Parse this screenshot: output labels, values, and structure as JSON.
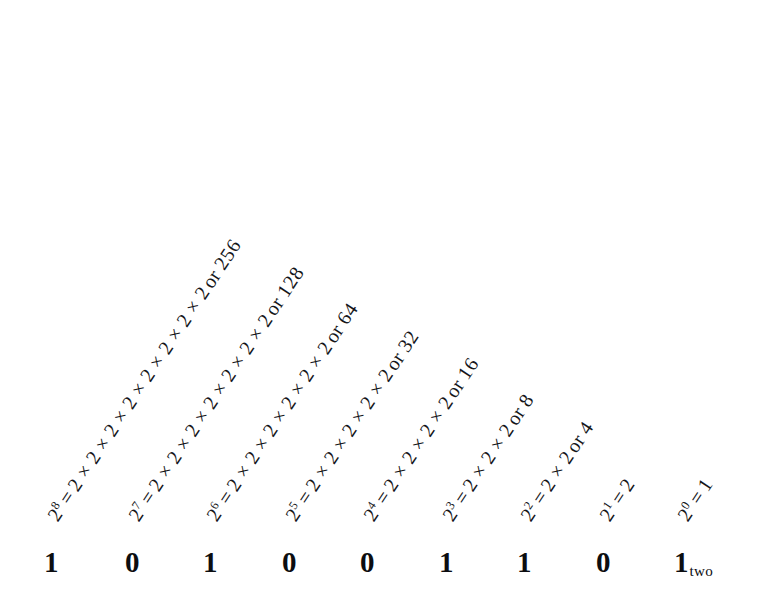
{
  "figure": {
    "kind": "binary-place-value-diagram",
    "background_color": "#ffffff",
    "text_color": "#15161a",
    "digit_color": "#0c0d10",
    "rotation_degrees": -56.5,
    "multiplication_sign": "×",
    "equals_sign": "=",
    "or_word": "or",
    "base_subscript": "two"
  },
  "rows": [
    {
      "base": "2",
      "exponent": "8",
      "equals": "=",
      "expression": "2 × 2 × 2 × 2 × 2 × 2 × 2 × 2",
      "or": "or",
      "value": "256",
      "factor_count": 8,
      "left": 52,
      "top": 509
    },
    {
      "base": "2",
      "exponent": "7",
      "equals": "=",
      "expression": "2 × 2 × 2 × 2 × 2 × 2 × 2",
      "or": "or",
      "value": "128",
      "factor_count": 7,
      "left": 133,
      "top": 509
    },
    {
      "base": "2",
      "exponent": "6",
      "equals": "=",
      "expression": "2 × 2 × 2 × 2 × 2 × 2",
      "or": "or",
      "value": "64",
      "factor_count": 6,
      "left": 211,
      "top": 509
    },
    {
      "base": "2",
      "exponent": "5",
      "equals": "=",
      "expression": "2 × 2 × 2 × 2 × 2",
      "or": "or",
      "value": "32",
      "factor_count": 5,
      "left": 290,
      "top": 509
    },
    {
      "base": "2",
      "exponent": "4",
      "equals": "=",
      "expression": "2 × 2 × 2 × 2",
      "or": "or",
      "value": "16",
      "factor_count": 4,
      "left": 368,
      "top": 509
    },
    {
      "base": "2",
      "exponent": "3",
      "equals": "=",
      "expression": "2 × 2 × 2",
      "or": "or",
      "value": "8",
      "factor_count": 3,
      "left": 447,
      "top": 509
    },
    {
      "base": "2",
      "exponent": "2",
      "equals": "=",
      "expression": "2 × 2",
      "or": "or",
      "value": "4",
      "factor_count": 2,
      "left": 525,
      "top": 509
    },
    {
      "base": "2",
      "exponent": "1",
      "equals": "=",
      "expression": "2",
      "or": "",
      "value": "",
      "factor_count": 1,
      "left": 604,
      "top": 509
    },
    {
      "base": "2",
      "exponent": "0",
      "equals": "=",
      "expression": "1",
      "or": "",
      "value": "",
      "factor_count": 0,
      "left": 682,
      "top": 509
    }
  ],
  "binary_number": {
    "digits": [
      {
        "value": "1",
        "left": 44
      },
      {
        "value": "0",
        "left": 125
      },
      {
        "value": "1",
        "left": 203
      },
      {
        "value": "0",
        "left": 282
      },
      {
        "value": "0",
        "left": 360
      },
      {
        "value": "1",
        "left": 439
      },
      {
        "value": "1",
        "left": 517
      },
      {
        "value": "0",
        "left": 596
      },
      {
        "value": "1",
        "left": 674
      }
    ],
    "subscript": "two",
    "full_string": "101001101"
  }
}
